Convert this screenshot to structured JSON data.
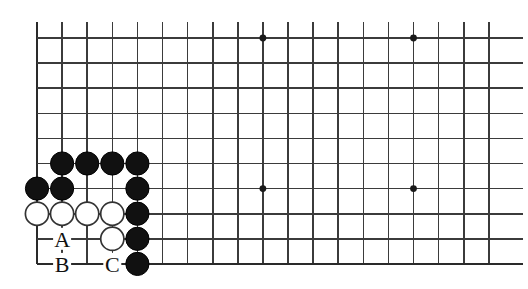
{
  "figure": {
    "kind": "go-board-diagram",
    "title": "",
    "background_color": "#ffffff",
    "line_color": "#3b3b3b",
    "edge_color": "#2a2a2a",
    "black_stone_color": "#111111",
    "white_stone_color": "#ffffff"
  },
  "board": {
    "origin_x": 37,
    "origin_y": 38,
    "spacing": 25.1,
    "cols": 19,
    "rows": 10,
    "left_edge_col": 0,
    "bottom_edge_row": 9,
    "top_open": true,
    "right_open": true,
    "stone_radius": 11.6,
    "star_radius": 3.4
  },
  "star_points": [
    {
      "col": 9,
      "row": 0
    },
    {
      "col": 15,
      "row": 0
    },
    {
      "col": 9,
      "row": 6
    },
    {
      "col": 15,
      "row": 6
    }
  ],
  "stones": [
    {
      "color": "black",
      "col": 1,
      "row": 5
    },
    {
      "color": "black",
      "col": 2,
      "row": 5
    },
    {
      "color": "black",
      "col": 3,
      "row": 5
    },
    {
      "color": "black",
      "col": 4,
      "row": 5
    },
    {
      "color": "black",
      "col": 0,
      "row": 6
    },
    {
      "color": "black",
      "col": 1,
      "row": 6
    },
    {
      "color": "black",
      "col": 4,
      "row": 6
    },
    {
      "color": "white",
      "col": 0,
      "row": 7
    },
    {
      "color": "white",
      "col": 1,
      "row": 7
    },
    {
      "color": "white",
      "col": 2,
      "row": 7
    },
    {
      "color": "white",
      "col": 3,
      "row": 7
    },
    {
      "color": "black",
      "col": 4,
      "row": 7
    },
    {
      "color": "white",
      "col": 3,
      "row": 8
    },
    {
      "color": "black",
      "col": 4,
      "row": 8
    },
    {
      "color": "black",
      "col": 4,
      "row": 9
    }
  ],
  "labels": [
    {
      "text": "A",
      "col": 1,
      "row": 8
    },
    {
      "text": "B",
      "col": 1,
      "row": 9
    },
    {
      "text": "C",
      "col": 3,
      "row": 9
    }
  ]
}
